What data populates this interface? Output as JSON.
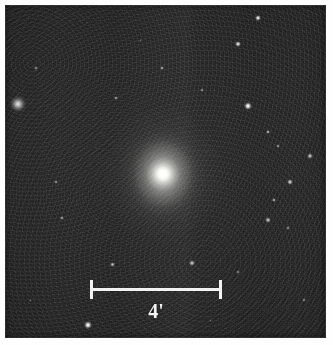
{
  "figure": {
    "kind": "astronomical-photograph",
    "palette": "grayscale",
    "page_background": "#ffffff",
    "sky_background": "#1d1d1d",
    "star_color": "#ffffff",
    "annotation_color": "#f2f2f0"
  },
  "image_frame": {
    "left": 5,
    "top": 5,
    "width": 321,
    "height": 333
  },
  "scalebar": {
    "label": "4'",
    "value": 4,
    "unit": "arcmin",
    "unit_symbol": "'",
    "x_left": 90,
    "x_right": 222,
    "y": 288,
    "length_px": 132,
    "color": "#f2f2f0"
  },
  "galaxy": {
    "name": "central-galaxy",
    "center_x": 163,
    "center_y": 174,
    "core_radius_px": 17,
    "halo_radius_px": 62,
    "elongation": "slightly elongated north-south",
    "peak_brightness": "#ffffff"
  },
  "companion": {
    "name": "companion-object",
    "center_x": 18,
    "center_y": 104,
    "radius_px": 9,
    "description": "faint extended fuzzy object at upper left"
  },
  "stars": [
    {
      "x": 258,
      "y": 18,
      "r": 3.4,
      "b": 0.95
    },
    {
      "x": 238,
      "y": 44,
      "r": 3.0,
      "b": 0.9
    },
    {
      "x": 162,
      "y": 68,
      "r": 2.2,
      "b": 0.62
    },
    {
      "x": 116,
      "y": 98,
      "r": 2.2,
      "b": 0.58
    },
    {
      "x": 248,
      "y": 106,
      "r": 4.3,
      "b": 1.0
    },
    {
      "x": 202,
      "y": 90,
      "r": 1.7,
      "b": 0.45
    },
    {
      "x": 268,
      "y": 132,
      "r": 2.4,
      "b": 0.7
    },
    {
      "x": 278,
      "y": 146,
      "r": 2.0,
      "b": 0.52
    },
    {
      "x": 310,
      "y": 156,
      "r": 2.6,
      "b": 0.74
    },
    {
      "x": 36,
      "y": 68,
      "r": 1.8,
      "b": 0.48
    },
    {
      "x": 56,
      "y": 182,
      "r": 2.1,
      "b": 0.52
    },
    {
      "x": 290,
      "y": 182,
      "r": 2.8,
      "b": 0.8
    },
    {
      "x": 274,
      "y": 200,
      "r": 2.4,
      "b": 0.66
    },
    {
      "x": 268,
      "y": 220,
      "r": 2.6,
      "b": 0.72
    },
    {
      "x": 288,
      "y": 228,
      "r": 2.0,
      "b": 0.5
    },
    {
      "x": 62,
      "y": 218,
      "r": 2.2,
      "b": 0.58
    },
    {
      "x": 112,
      "y": 264,
      "r": 2.5,
      "b": 0.72
    },
    {
      "x": 192,
      "y": 263,
      "r": 2.6,
      "b": 0.76
    },
    {
      "x": 88,
      "y": 325,
      "r": 4.0,
      "b": 1.0
    },
    {
      "x": 238,
      "y": 272,
      "r": 1.7,
      "b": 0.42
    },
    {
      "x": 304,
      "y": 300,
      "r": 1.8,
      "b": 0.44
    },
    {
      "x": 140,
      "y": 40,
      "r": 1.5,
      "b": 0.34
    },
    {
      "x": 206,
      "y": 152,
      "r": 1.4,
      "b": 0.3
    },
    {
      "x": 96,
      "y": 148,
      "r": 1.4,
      "b": 0.3
    },
    {
      "x": 30,
      "y": 300,
      "r": 1.5,
      "b": 0.32
    },
    {
      "x": 210,
      "y": 320,
      "r": 1.5,
      "b": 0.32
    }
  ]
}
